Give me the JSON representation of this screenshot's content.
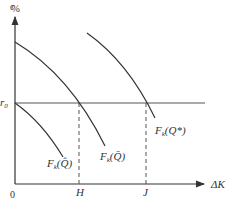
{
  "diagram": {
    "y_axis_label": "%",
    "y_axis_label_prefix": "c",
    "x_axis_label": "ΔK",
    "origin_label": "0",
    "rate_label": "r",
    "rate_subscript": "0",
    "x_marks": [
      {
        "label": "H",
        "x": 79
      },
      {
        "label": "J",
        "x": 146
      }
    ],
    "curves": [
      {
        "label": "F",
        "subscript": "k",
        "arg": "(Q̂)",
        "name": "F_k(Q-hat)"
      },
      {
        "label": "F",
        "subscript": "k",
        "arg": "(Q̄)",
        "name": "F_k(Q-bar)"
      },
      {
        "label": "F",
        "subscript": "k",
        "arg": "(Q*)",
        "name": "F_k(Q-star)"
      }
    ],
    "colors": {
      "line": "#333333",
      "rate_line": "#555555"
    }
  }
}
